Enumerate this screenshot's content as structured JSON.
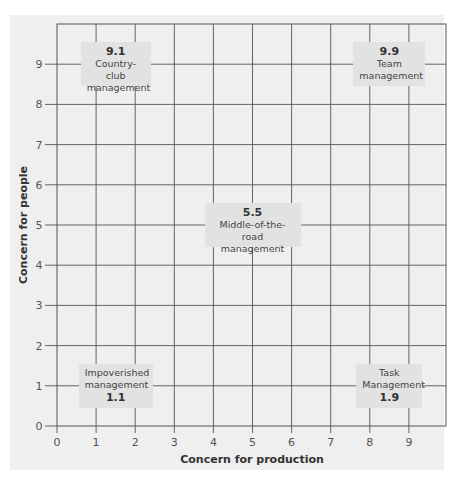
{
  "chart_data": {
    "type": "scatter",
    "title": "",
    "xlabel": "Concern for production",
    "ylabel": "Concern for people",
    "xlim": [
      0,
      9.9
    ],
    "ylim": [
      0,
      9.9
    ],
    "x_ticks": [
      "0",
      "1",
      "2",
      "3",
      "4",
      "5",
      "6",
      "7",
      "8",
      "9"
    ],
    "y_ticks": [
      "0",
      "1",
      "2",
      "3",
      "4",
      "5",
      "6",
      "7",
      "8",
      "9"
    ],
    "grid": true,
    "legend": null,
    "annotations": [
      {
        "code": "9.1",
        "label": "Country-club management",
        "line1": "Country-club",
        "line2": "management",
        "x": 1,
        "y": 9,
        "code_position": "top"
      },
      {
        "code": "9.9",
        "label": "Team management",
        "line1": "Team",
        "line2": "management",
        "x": 9,
        "y": 9,
        "code_position": "top"
      },
      {
        "code": "5.5",
        "label": "Middle-of-the-road management",
        "line1": "Middle-of-the-road",
        "line2": "management",
        "x": 5,
        "y": 5,
        "code_position": "top"
      },
      {
        "code": "1.1",
        "label": "Impoverished management",
        "line1": "Impoverished",
        "line2": "management",
        "x": 1,
        "y": 1,
        "code_position": "bottom"
      },
      {
        "code": "1.9",
        "label": "Task Management",
        "line1": "Task",
        "line2": "Management",
        "x": 9,
        "y": 1,
        "code_position": "bottom"
      }
    ]
  }
}
